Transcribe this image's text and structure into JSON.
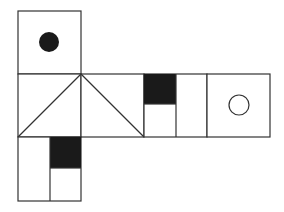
{
  "diagram": {
    "type": "cube-net",
    "stroke_color": "#333333",
    "fill_dark": "#1a1a1a",
    "background": "#ffffff",
    "faces": [
      {
        "id": "top-face",
        "x": 18,
        "y": 11,
        "w": 63,
        "h": 63,
        "pattern": "filled-dot"
      },
      {
        "id": "triangle-face-left",
        "x": 18,
        "y": 74,
        "w": 63,
        "h": 63,
        "pattern": "diagonal-up"
      },
      {
        "id": "triangle-face-mid",
        "x": 81,
        "y": 74,
        "w": 63,
        "h": 63,
        "pattern": "diagonal-down"
      },
      {
        "id": "split-face-right",
        "x": 144,
        "y": 74,
        "w": 63,
        "h": 63,
        "pattern": "half-split-dark-top-left"
      },
      {
        "id": "circle-face",
        "x": 207,
        "y": 74,
        "w": 63,
        "h": 63,
        "pattern": "open-circle"
      },
      {
        "id": "bottom-face",
        "x": 18,
        "y": 137,
        "w": 63,
        "h": 64,
        "pattern": "half-split-dark-top-right"
      }
    ]
  }
}
